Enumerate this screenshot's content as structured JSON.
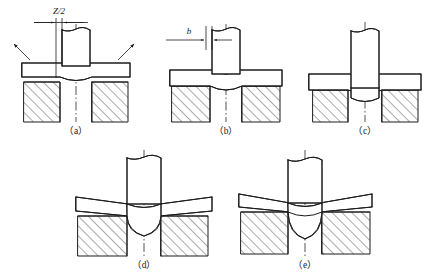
{
  "figure": {
    "title": "",
    "background_color": "#ffffff",
    "line_color": "#1c1c1c",
    "panel_count": 5
  },
  "panels": [
    {
      "id": "a",
      "caption": "（a）",
      "stage_description": "punch contacting sheet, elastic deformation, sheet edges lift",
      "annotations": [
        {
          "name": "clearance-dimension",
          "label": "Z/2",
          "kind": "dimension"
        },
        {
          "name": "force-arrow-left",
          "label": "",
          "kind": "arrow"
        },
        {
          "name": "force-arrow-right",
          "label": "",
          "kind": "arrow"
        }
      ]
    },
    {
      "id": "b",
      "caption": "（b）",
      "stage_description": "plastic deformation, punch penetrating, rollover forming",
      "annotations": [
        {
          "name": "burnish-dimension",
          "label": "b",
          "kind": "dimension"
        }
      ]
    },
    {
      "id": "c",
      "caption": "（c）",
      "stage_description": "shearing, burnished band developing on slug wall",
      "annotations": []
    },
    {
      "id": "d",
      "caption": "（d）",
      "stage_description": "fracture initiation, cracks propagate from punch and die edges",
      "annotations": []
    },
    {
      "id": "e",
      "caption": "（e）",
      "stage_description": "complete separation, slug pushed into die opening",
      "annotations": []
    }
  ],
  "components": {
    "punch": "punch",
    "sheet": "sheet-metal-blank",
    "die": "die-block",
    "slug": "blanked-slug",
    "centerline": "axis-centerline",
    "hatching": "section-hatching"
  },
  "colors": {
    "line": "#1c1c1c",
    "centerline": "#2a2a2a",
    "background": "#ffffff",
    "hatch": "#1c1c1c"
  }
}
